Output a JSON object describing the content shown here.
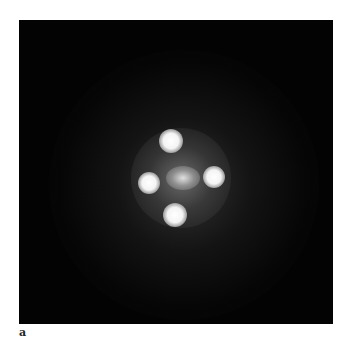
{
  "figure": {
    "panel_label": "a",
    "background_color": "#030303",
    "sources": [
      {
        "name": "image-top",
        "cx": 152,
        "cy": 121,
        "r": 12
      },
      {
        "name": "image-left",
        "cx": 130,
        "cy": 163,
        "r": 11
      },
      {
        "name": "image-right",
        "cx": 195,
        "cy": 157,
        "r": 11
      },
      {
        "name": "image-bottom",
        "cx": 156,
        "cy": 195,
        "r": 12
      }
    ],
    "lens_galaxy": {
      "cx": 164,
      "cy": 158,
      "rx": 17,
      "ry": 12
    }
  }
}
